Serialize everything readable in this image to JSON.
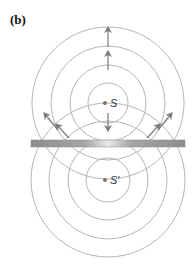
{
  "panel_label": "(b)",
  "source": {
    "label": "S",
    "cx": 108,
    "cy": 103,
    "radii": [
      20,
      38,
      57,
      76
    ]
  },
  "image_source": {
    "label": "S′",
    "cx": 108,
    "cy": 180,
    "radii": [
      22,
      40,
      59,
      77
    ]
  },
  "mirror": {
    "x": 31,
    "y": 140,
    "width": 154,
    "height": 7
  },
  "colors": {
    "wavefront": "#b5b5b5",
    "arrow": "#7a7a7a",
    "mirror_dark": "#8c8c8c",
    "mirror_light": "#e4e4e4",
    "dot": "#777777"
  },
  "arrows": [
    {
      "name": "up-arrow-outer",
      "x1": 108,
      "y1": 47,
      "x2": 108,
      "y2": 27
    },
    {
      "name": "up-arrow-inner",
      "x1": 108,
      "y1": 70,
      "x2": 108,
      "y2": 51
    },
    {
      "name": "down-arrow-reflected",
      "x1": 108,
      "y1": 113,
      "x2": 108,
      "y2": 131
    },
    {
      "name": "up-left-arrow-outer",
      "x1": 58,
      "y1": 130,
      "x2": 44,
      "y2": 113
    },
    {
      "name": "up-left-arrow-inner",
      "x1": 69,
      "y1": 138,
      "x2": 56,
      "y2": 124
    },
    {
      "name": "up-right-arrow-outer",
      "x1": 158,
      "y1": 130,
      "x2": 172,
      "y2": 113
    },
    {
      "name": "up-right-arrow-inner",
      "x1": 147,
      "y1": 138,
      "x2": 160,
      "y2": 124
    }
  ]
}
